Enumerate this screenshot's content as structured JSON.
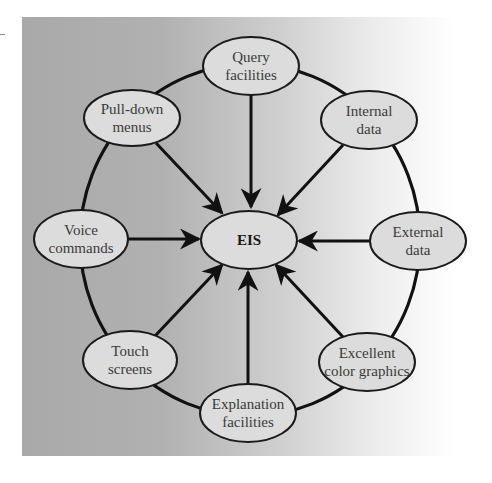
{
  "diagram": {
    "center": {
      "label": "EIS",
      "cx": 249,
      "cy": 240,
      "rx": 48,
      "ry": 29
    },
    "nodes": [
      {
        "id": "query-facilities",
        "lines": [
          "Query",
          "facilities"
        ],
        "cx": 251,
        "cy": 66,
        "rx": 48,
        "ry": 29,
        "arrow_from": [
          251,
          95
        ],
        "arrow_to": [
          251,
          207
        ]
      },
      {
        "id": "internal-data",
        "lines": [
          "Internal",
          "data"
        ],
        "cx": 369,
        "cy": 120,
        "rx": 48,
        "ry": 29,
        "arrow_from": [
          343,
          145
        ],
        "arrow_to": [
          278,
          215
        ]
      },
      {
        "id": "external-data",
        "lines": [
          "External",
          "data"
        ],
        "cx": 418,
        "cy": 241,
        "rx": 48,
        "ry": 29,
        "arrow_from": [
          370,
          241
        ],
        "arrow_to": [
          299,
          241
        ]
      },
      {
        "id": "excellent-color-graphics",
        "lines": [
          "Excellent",
          "color graphics"
        ],
        "cx": 367,
        "cy": 362,
        "rx": 48,
        "ry": 29,
        "arrow_from": [
          343,
          337
        ],
        "arrow_to": [
          276,
          265
        ]
      },
      {
        "id": "explanation-facilities",
        "lines": [
          "Explanation",
          "facilities"
        ],
        "cx": 248,
        "cy": 413,
        "rx": 48,
        "ry": 29,
        "arrow_from": [
          248,
          384
        ],
        "arrow_to": [
          248,
          272
        ]
      },
      {
        "id": "touch-screens",
        "lines": [
          "Touch",
          "screens"
        ],
        "cx": 130,
        "cy": 360,
        "rx": 47,
        "ry": 29,
        "arrow_from": [
          155,
          336
        ],
        "arrow_to": [
          222,
          265
        ]
      },
      {
        "id": "voice-commands",
        "lines": [
          "Voice",
          "commands"
        ],
        "cx": 81,
        "cy": 239,
        "rx": 47,
        "ry": 29,
        "arrow_from": [
          128,
          239
        ],
        "arrow_to": [
          199,
          239
        ]
      },
      {
        "id": "pull-down-menus",
        "lines": [
          "Pull-down",
          "menus"
        ],
        "cx": 132,
        "cy": 118,
        "rx": 48,
        "ry": 28,
        "arrow_from": [
          156,
          143
        ],
        "arrow_to": [
          222,
          213
        ]
      }
    ],
    "ring": {
      "cx": 250,
      "cy": 240,
      "rx": 170,
      "ry": 176
    },
    "colors": {
      "node_fill": "#dcdcdc",
      "stroke": "#111111",
      "panel_left": "#a9a9a9",
      "panel_right": "#ffffff"
    }
  }
}
